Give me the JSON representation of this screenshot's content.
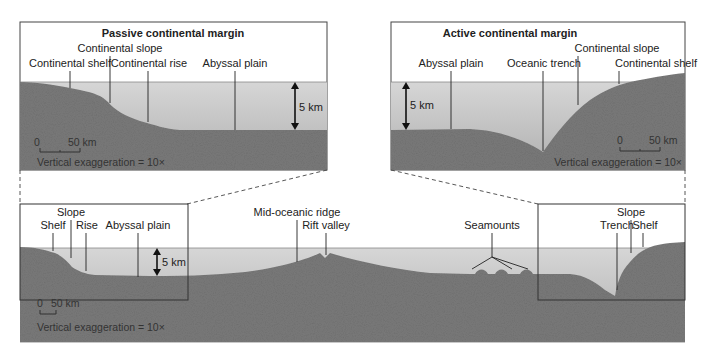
{
  "colors": {
    "water_top": "#d4d4d4",
    "water_bottom": "#b3b3b3",
    "rock": "#7d7d7d",
    "rock_dark": "#6c6c6c",
    "frame": "#333333",
    "leader": "#222222"
  },
  "passive_panel": {
    "title": "Passive continental margin",
    "labels": {
      "continental_shelf": "Continental shelf",
      "continental_slope": "Continental slope",
      "continental_rise": "Continental rise",
      "abyssal_plain": "Abyssal plain"
    },
    "depth_label": "5 km",
    "scale_zero": "0",
    "scale_end": "50 km",
    "exaggeration": "Vertical exaggeration = 10×"
  },
  "active_panel": {
    "title": "Active continental margin",
    "labels": {
      "abyssal_plain": "Abyssal plain",
      "oceanic_trench": "Oceanic trench",
      "continental_slope": "Continental slope",
      "continental_shelf": "Continental shelf"
    },
    "depth_label": "5 km",
    "scale_zero": "0",
    "scale_end": "50 km",
    "exaggeration": "Vertical exaggeration = 10×"
  },
  "overview_panel": {
    "labels": {
      "slope_left": "Slope",
      "shelf_left": "Shelf",
      "rise": "Rise",
      "abyssal_plain": "Abyssal plain",
      "mid_oceanic_ridge": "Mid-oceanic ridge",
      "rift_valley": "Rift valley",
      "seamounts": "Seamounts",
      "slope_right": "Slope",
      "trench": "Trench",
      "shelf_right": "Shelf"
    },
    "depth_label": "5 km",
    "scale_zero": "0",
    "scale_end": "50 km",
    "exaggeration": "Vertical exaggeration = 10×"
  }
}
